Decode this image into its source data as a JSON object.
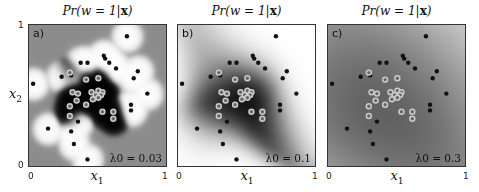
{
  "chart_data": {
    "type": "heatmap",
    "title": "Pr(w = 1|x)",
    "xlabel": "x1",
    "ylabel": "x2",
    "xlim": [
      0,
      1
    ],
    "ylim": [
      0,
      1
    ],
    "x_ticks": [
      "0",
      "1"
    ],
    "y_ticks": [
      "0",
      "1"
    ],
    "panels": [
      {
        "label": "a)",
        "lambda_label": "λ0 = 0.03",
        "lambda": 0.03,
        "kernel_width": 0.04,
        "background": "#8a8a8a"
      },
      {
        "label": "b)",
        "lambda_label": "λ0 = 0.1",
        "lambda": 0.1,
        "kernel_width": 0.12,
        "background": "#eeeeee"
      },
      {
        "label": "c)",
        "lambda_label": "λ0 = 0.3",
        "lambda": 0.3,
        "kernel_width": 0.3,
        "background": "#f4f4f4"
      }
    ],
    "class_0_points": [
      [
        0.72,
        0.92
      ],
      [
        0.38,
        0.73
      ],
      [
        0.43,
        0.73
      ],
      [
        0.55,
        0.78
      ],
      [
        0.56,
        0.76
      ],
      [
        0.59,
        0.73
      ],
      [
        0.64,
        0.69
      ],
      [
        0.8,
        0.67
      ],
      [
        0.77,
        0.62
      ],
      [
        0.24,
        0.63
      ],
      [
        0.31,
        0.64
      ],
      [
        0.03,
        0.58
      ],
      [
        0.87,
        0.51
      ],
      [
        0.75,
        0.43
      ],
      [
        0.75,
        0.39
      ],
      [
        0.36,
        0.31
      ],
      [
        0.14,
        0.26
      ],
      [
        0.31,
        0.24
      ],
      [
        0.33,
        0.15
      ],
      [
        0.43,
        0.04
      ]
    ],
    "class_1_points": [
      [
        0.51,
        0.62
      ],
      [
        0.42,
        0.61
      ],
      [
        0.3,
        0.66
      ],
      [
        0.32,
        0.52
      ],
      [
        0.36,
        0.51
      ],
      [
        0.46,
        0.52
      ],
      [
        0.51,
        0.53
      ],
      [
        0.54,
        0.52
      ],
      [
        0.49,
        0.5
      ],
      [
        0.53,
        0.5
      ],
      [
        0.47,
        0.47
      ],
      [
        0.51,
        0.48
      ],
      [
        0.35,
        0.46
      ],
      [
        0.42,
        0.43
      ],
      [
        0.3,
        0.42
      ],
      [
        0.3,
        0.35
      ],
      [
        0.54,
        0.38
      ],
      [
        0.62,
        0.38
      ],
      [
        0.62,
        0.33
      ]
    ]
  },
  "labels": {
    "title": "Pr(w = 1|",
    "title_bold": "x",
    "title_close": ")",
    "x_axis": "x",
    "x_sub": "1",
    "y_axis": "x",
    "y_sub": "2",
    "tick0": "0",
    "tick1": "1"
  }
}
